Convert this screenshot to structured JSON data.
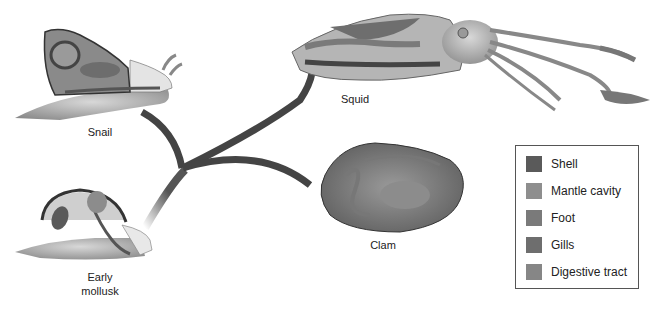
{
  "diagram": {
    "type": "evolutionary-tree",
    "root": "Early mollusk",
    "branches": [
      "Snail",
      "Squid",
      "Clam"
    ]
  },
  "labels": {
    "snail": "Snail",
    "squid": "Squid",
    "clam": "Clam",
    "early_line1": "Early",
    "early_line2": "mollusk"
  },
  "legend": {
    "items": [
      {
        "label": "Shell",
        "color": "#5a5a5a"
      },
      {
        "label": "Mantle cavity",
        "color": "#8e8e8e"
      },
      {
        "label": "Foot",
        "color": "#7a7a7a"
      },
      {
        "label": "Gills",
        "color": "#6e6e6e"
      },
      {
        "label": "Digestive tract",
        "color": "#868686"
      }
    ]
  }
}
